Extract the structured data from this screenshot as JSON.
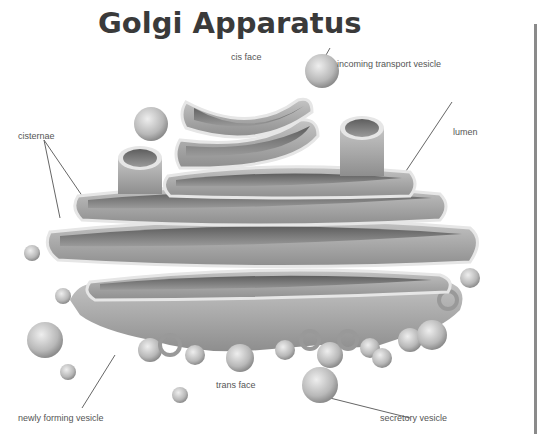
{
  "title": "Golgi Apparatus",
  "labels": {
    "cis_face": "cis face",
    "incoming_transport_vesicle": "incoming transport vesicle",
    "cisternae": "cisternae",
    "lumen": "lumen",
    "trans_face": "trans face",
    "newly_forming_vesicle": "newly forming vesicle",
    "secretory_vesicle": "secretory vesicle"
  },
  "colors": {
    "title": "#3a3a3a",
    "label": "#555555",
    "structure_fill": "#a8a8a8",
    "structure_dark": "#6e6e6e",
    "structure_light": "#e4e4e4",
    "divider": "#8a8a8a"
  }
}
